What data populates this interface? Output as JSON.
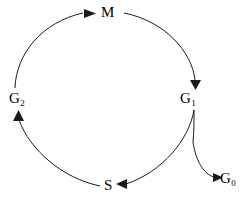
{
  "diagram": {
    "type": "cycle-diagram",
    "background_color": "#ffffff",
    "stroke_color": "#1a1a1a",
    "text_color": "#000000",
    "nodes": [
      {
        "id": "M",
        "base": "M",
        "sub": "",
        "position": "top",
        "x": 108,
        "y": 12
      },
      {
        "id": "G1",
        "base": "G",
        "sub": "1",
        "position": "right",
        "x": 188,
        "y": 98
      },
      {
        "id": "S",
        "base": "S",
        "sub": "",
        "position": "bottom",
        "x": 109,
        "y": 185
      },
      {
        "id": "G2",
        "base": "G",
        "sub": "2",
        "position": "left",
        "x": 17,
        "y": 98
      },
      {
        "id": "G0",
        "base": "G",
        "sub": "0",
        "position": "bottom-right",
        "x": 230,
        "y": 178
      }
    ],
    "edges": [
      {
        "from": "G2",
        "to": "M",
        "arrowhead": "right",
        "style": "arc"
      },
      {
        "from": "M",
        "to": "G1",
        "arrowhead": "down",
        "style": "arc"
      },
      {
        "from": "G1",
        "to": "S",
        "arrowhead": "left",
        "style": "arc"
      },
      {
        "from": "S",
        "to": "G2",
        "arrowhead": "up",
        "style": "arc"
      },
      {
        "from": "G1",
        "to": "G0",
        "arrowhead": "right",
        "style": "branch"
      }
    ]
  }
}
